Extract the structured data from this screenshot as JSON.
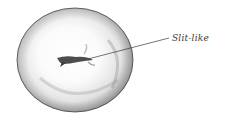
{
  "figure": {
    "shape_description": "rounded disc with central slit opening"
  },
  "annotations": [
    {
      "label": "Slit-like",
      "target": "central opening"
    }
  ],
  "colors": {
    "outline": "#3a3a3a",
    "shade_dark": "#8a8a8a",
    "shade_light": "#f4f4f4",
    "opening": "#2a2a2a"
  }
}
